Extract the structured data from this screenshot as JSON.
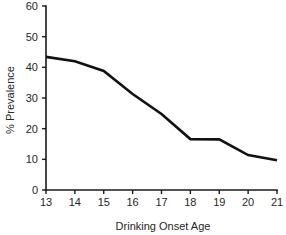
{
  "chart_data": {
    "type": "line",
    "title": "",
    "subtitle": "",
    "xlabel": "Drinking Onset Age",
    "ylabel": "% Prevalence",
    "x": [
      13,
      14,
      15,
      16,
      17,
      18,
      19,
      20,
      21
    ],
    "values": [
      43.4,
      42.0,
      38.8,
      31.3,
      24.8,
      16.6,
      16.5,
      11.4,
      9.7
    ],
    "categories": [
      "13",
      "14",
      "15",
      "16",
      "17",
      "18",
      "19",
      "20",
      "21"
    ],
    "xtick_labels": [
      "13",
      "14",
      "15",
      "16",
      "17",
      "18",
      "19",
      "20",
      "21"
    ],
    "ytick_labels": [
      "0",
      "10",
      "20",
      "30",
      "40",
      "50",
      "60"
    ],
    "yticks": [
      0,
      10,
      20,
      30,
      40,
      50,
      60
    ],
    "xlim": [
      13,
      21
    ],
    "ylim": [
      0,
      60
    ],
    "grid": false,
    "legend": false,
    "legend_position": "none",
    "line_color": "#111111",
    "axis_color": "#1a1a1a",
    "text_color": "#262626",
    "background": "#ffffff"
  }
}
